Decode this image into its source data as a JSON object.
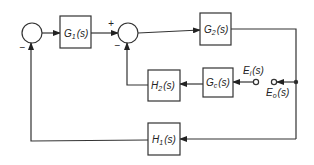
{
  "diagram": {
    "type": "control-system-block-diagram",
    "blocks": {
      "g1": {
        "label": "G",
        "sub": "1",
        "arg": "(s)"
      },
      "g2": {
        "label": "G",
        "sub": "2",
        "arg": "(s)"
      },
      "gc": {
        "label": "G",
        "sub": "c",
        "arg": "(s)"
      },
      "h2": {
        "label": "H",
        "sub": "2",
        "arg": "(s)"
      },
      "h1": {
        "label": "H",
        "sub": "1",
        "arg": "(s)"
      }
    },
    "signals": {
      "ei": {
        "label": "E",
        "sub": "i",
        "arg": "(s)"
      },
      "eo": {
        "label": "E",
        "sub": "o",
        "arg": "(s)"
      }
    },
    "junctions": {
      "sum1": {
        "minus": "−"
      },
      "sum2": {
        "plus": "+",
        "minus": "−"
      }
    },
    "colors": {
      "stroke": "#333333",
      "background": "#ffffff"
    }
  }
}
